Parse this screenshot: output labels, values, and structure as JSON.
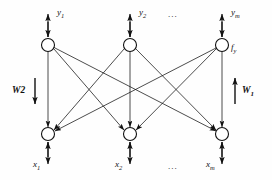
{
  "figure": {
    "background_color": "#fefefe",
    "stroke_color": "#111111",
    "node_fill": "#ffffff"
  },
  "layers": {
    "output": {
      "node_label_right": "f",
      "node_label_right_sub": "y",
      "nodes": [
        {
          "label": "y",
          "sub": "1",
          "cx": 48,
          "cy": 45
        },
        {
          "label": "y",
          "sub": "2",
          "cx": 130,
          "cy": 45
        },
        {
          "label": "y",
          "sub": "m",
          "cx": 222,
          "cy": 45
        }
      ],
      "ellipsis": "..."
    },
    "input": {
      "nodes": [
        {
          "label": "x",
          "sub": "1",
          "cx": 48,
          "cy": 134
        },
        {
          "label": "x",
          "sub": "2",
          "cx": 130,
          "cy": 134
        },
        {
          "label": "x",
          "sub": "m",
          "cx": 222,
          "cy": 134
        }
      ],
      "ellipsis": "..."
    }
  },
  "weights": {
    "left": {
      "label": "W2",
      "sub": "",
      "direction": "down"
    },
    "right": {
      "label": "W",
      "sub": "1",
      "direction": "up"
    }
  },
  "geometry": {
    "node_radius": 6.5,
    "top_y": 45,
    "bottom_y": 134,
    "columns": [
      48,
      130,
      222
    ]
  }
}
